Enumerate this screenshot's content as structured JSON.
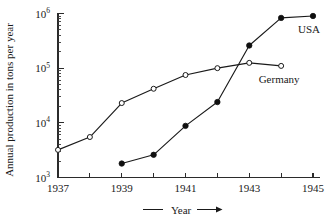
{
  "chart_data": {
    "type": "line",
    "title": "",
    "xlabel": "Year",
    "ylabel": "Annual production in tons per year",
    "yscale": "log",
    "ylim": [
      1000,
      1000000
    ],
    "xlim": [
      1937,
      1945
    ],
    "grid": false,
    "legend_position": "inline-right",
    "y_tick_labels": [
      "10",
      "10",
      "10",
      "10"
    ],
    "y_tick_exponents": [
      "3",
      "4",
      "5",
      "6"
    ],
    "y_tick_values": [
      1000,
      10000,
      100000,
      1000000
    ],
    "x_tick_labels": [
      "1937",
      "",
      "1939",
      "",
      "1941",
      "",
      "1943",
      "",
      "1945"
    ],
    "x_tick_values": [
      1937,
      1938,
      1939,
      1940,
      1941,
      1942,
      1943,
      1944,
      1945
    ],
    "xaxis_arrow": "⟶",
    "series": [
      {
        "name": "Germany",
        "marker": "open-circle",
        "label": "Germany",
        "x": [
          1937,
          1938,
          1939,
          1940,
          1941,
          1942,
          1943,
          1944
        ],
        "values": [
          3200,
          5500,
          23000,
          42000,
          75000,
          100000,
          125000,
          110000
        ]
      },
      {
        "name": "USA",
        "marker": "filled-circle",
        "label": "USA",
        "x": [
          1939,
          1940,
          1941,
          1942,
          1943,
          1944,
          1945
        ],
        "values": [
          1800,
          2600,
          8800,
          24000,
          260000,
          830000,
          900000
        ]
      }
    ]
  },
  "colors": {
    "axis": "#2b2b2b",
    "line": "#1a1a1a",
    "marker_fill": "#101010",
    "marker_open_fill": "#ffffff",
    "background": "#ffffff"
  }
}
